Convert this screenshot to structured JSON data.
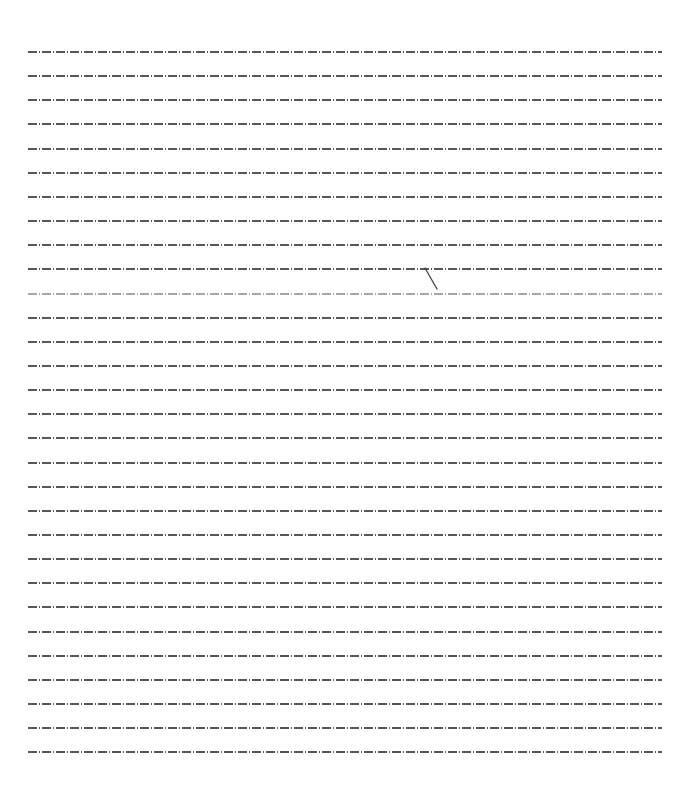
{
  "document": {
    "type": "lined-paper",
    "line_count": 30,
    "first_line_y": 51,
    "line_pitch": 24.15,
    "line_left": 28,
    "line_right": 662,
    "line_style": "dash-dot",
    "line_color": "#3a3a3a",
    "background_color": "#fefefe",
    "faint_line_index": 10,
    "marks": [
      {
        "type": "diagonal-stroke",
        "x1": 425,
        "y1": 268,
        "x2": 437,
        "y2": 289,
        "color": "#444444"
      }
    ]
  }
}
